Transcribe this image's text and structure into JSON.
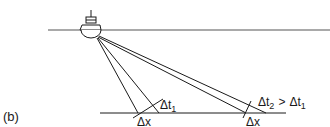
{
  "figure": {
    "panel_label": "(b)",
    "colors": {
      "line": "#1a1a1a",
      "background": "#ffffff"
    },
    "surface": {
      "name": "sea-surface"
    },
    "seafloor": {
      "name": "seafloor"
    },
    "ship": {
      "name": "survey-ship"
    },
    "near_beam": {
      "delta_t_label": "Δt",
      "delta_t_sub": "1",
      "delta_x_label": "Δx"
    },
    "far_beam": {
      "delta_t_label": "Δt",
      "delta_t_sub": "2",
      "comparison": ">",
      "compare_to_label": "Δt",
      "compare_to_sub": "1",
      "delta_x_label": "Δx"
    }
  }
}
